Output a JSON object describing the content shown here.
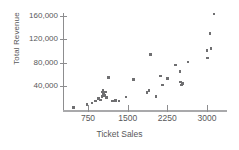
{
  "chart_data": {
    "type": "scatter",
    "title": "",
    "xlabel": "Ticket Sales",
    "ylabel": "Total Revenue",
    "xlim": [
      400,
      3200
    ],
    "ylim": [
      0,
      170000
    ],
    "xticks": [
      750,
      1500,
      2250,
      3000
    ],
    "xtick_labels": [
      "750",
      "1500",
      "2250",
      "3000"
    ],
    "yticks": [
      40000,
      80000,
      120000,
      160000
    ],
    "ytick_labels": [
      "40,000",
      "80,000",
      "120,000",
      "160,000"
    ],
    "grid": false,
    "legend": false,
    "marker_color": "#6f6f71",
    "axis_color": "#8d8d8f",
    "text_color": "#58585a",
    "points": [
      {
        "x": 480,
        "y": 3000
      },
      {
        "x": 730,
        "y": 8500
      },
      {
        "x": 830,
        "y": 11000
      },
      {
        "x": 890,
        "y": 14500
      },
      {
        "x": 950,
        "y": 19000
      },
      {
        "x": 990,
        "y": 16000
      },
      {
        "x": 1010,
        "y": 22000
      },
      {
        "x": 1020,
        "y": 30000
      },
      {
        "x": 1030,
        "y": 33500
      },
      {
        "x": 1040,
        "y": 26000
      },
      {
        "x": 1060,
        "y": 24000
      },
      {
        "x": 1080,
        "y": 30000
      },
      {
        "x": 1100,
        "y": 20000
      },
      {
        "x": 1140,
        "y": 55000
      },
      {
        "x": 1210,
        "y": 14500
      },
      {
        "x": 1270,
        "y": 15500
      },
      {
        "x": 1340,
        "y": 14500
      },
      {
        "x": 1470,
        "y": 21000
      },
      {
        "x": 1610,
        "y": 51000
      },
      {
        "x": 1870,
        "y": 28500
      },
      {
        "x": 1900,
        "y": 32500
      },
      {
        "x": 1930,
        "y": 94000
      },
      {
        "x": 2040,
        "y": 22000
      },
      {
        "x": 2120,
        "y": 57000
      },
      {
        "x": 2160,
        "y": 42000
      },
      {
        "x": 2250,
        "y": 53000
      },
      {
        "x": 2400,
        "y": 76000
      },
      {
        "x": 2490,
        "y": 65000
      },
      {
        "x": 2500,
        "y": 47000
      },
      {
        "x": 2520,
        "y": 42000
      },
      {
        "x": 2540,
        "y": 44000
      },
      {
        "x": 2640,
        "y": 81000
      },
      {
        "x": 3000,
        "y": 101000
      },
      {
        "x": 3010,
        "y": 88000
      },
      {
        "x": 3060,
        "y": 130000
      },
      {
        "x": 3080,
        "y": 104000
      },
      {
        "x": 3130,
        "y": 163000
      }
    ]
  }
}
